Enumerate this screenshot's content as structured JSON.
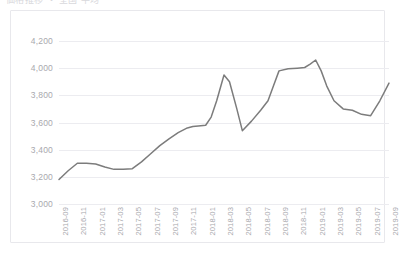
{
  "title_clipped": "価格推移  ・ 全国 平均",
  "chart_data": {
    "type": "line",
    "title": "",
    "xlabel": "",
    "ylabel": "",
    "ylim": [
      3000,
      4200
    ],
    "ytick_step": 200,
    "ytick_labels": [
      "4,200",
      "4,000",
      "3,800",
      "3,600",
      "3,400",
      "3,200",
      "3,000"
    ],
    "ytick_values": [
      4200,
      4000,
      3800,
      3600,
      3400,
      3200,
      3000
    ],
    "grid": true,
    "legend": false,
    "legend_position": "none",
    "line_color": "#7c7c7c",
    "line_width": 1.5,
    "markers": false,
    "categories": [
      "2016-09",
      "2016-11",
      "2017-01",
      "2017-03",
      "2017-05",
      "2017-07",
      "2017-09",
      "2017-11",
      "2018-01",
      "2018-03",
      "2018-05",
      "2018-07",
      "2018-09",
      "2018-11",
      "2019-01",
      "2019-03",
      "2019-05",
      "2019-07",
      "2019-09"
    ],
    "series": [
      {
        "name": "value",
        "values": [
          3180,
          3300,
          3295,
          3255,
          3260,
          3370,
          3480,
          3560,
          3580,
          3950,
          3540,
          3690,
          3980,
          4000,
          4060,
          3760,
          3690,
          3650,
          3890
        ]
      }
    ],
    "dense_points": {
      "note": "monthly interpolation used for the rendered polyline, x in category index units",
      "x": [
        0,
        0.5,
        1,
        1.5,
        2,
        2.5,
        3,
        3.5,
        4,
        4.5,
        5,
        5.5,
        6,
        6.5,
        7,
        7.3,
        7.6,
        8,
        8.3,
        8.6,
        9,
        9.3,
        9.7,
        10,
        10.5,
        11,
        11.4,
        11.7,
        12,
        12.5,
        13,
        13.4,
        13.7,
        14,
        14.3,
        14.6,
        15,
        15.5,
        16,
        16.5,
        17,
        17.5,
        18
      ],
      "y": [
        3180,
        3245,
        3300,
        3300,
        3295,
        3272,
        3255,
        3256,
        3260,
        3310,
        3370,
        3430,
        3480,
        3525,
        3560,
        3570,
        3575,
        3580,
        3640,
        3760,
        3950,
        3900,
        3700,
        3540,
        3610,
        3690,
        3760,
        3870,
        3980,
        3995,
        4000,
        4005,
        4030,
        4060,
        3980,
        3870,
        3760,
        3700,
        3690,
        3660,
        3650,
        3760,
        3890
      ]
    }
  }
}
